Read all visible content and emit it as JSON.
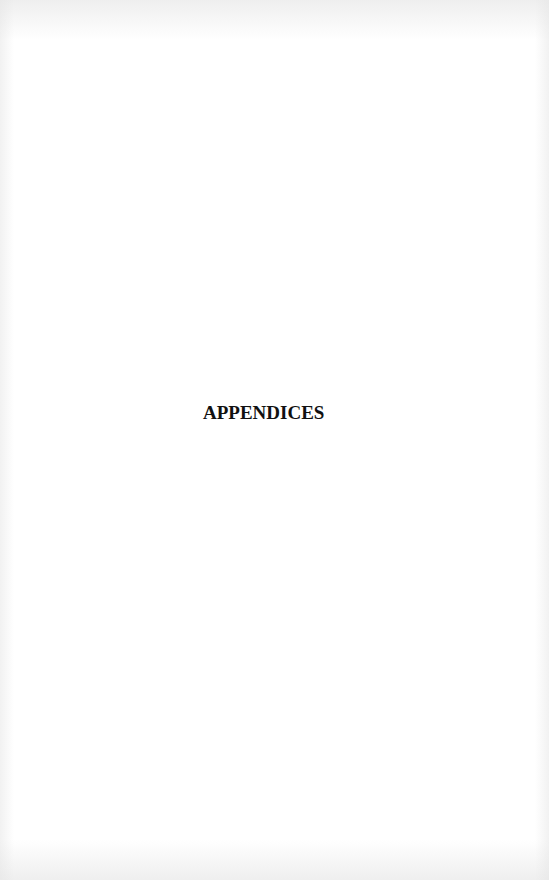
{
  "page": {
    "heading": "APPENDICES",
    "background_color": "#ffffff",
    "text_color": "#111111"
  }
}
